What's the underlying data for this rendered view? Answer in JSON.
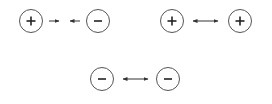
{
  "diagram": {
    "pairs": [
      {
        "left": {
          "sign": "+",
          "label": "positive-charge"
        },
        "right": {
          "sign": "−",
          "label": "negative-charge"
        },
        "relation": "attract"
      },
      {
        "left": {
          "sign": "+",
          "label": "positive-charge"
        },
        "right": {
          "sign": "+",
          "label": "positive-charge"
        },
        "relation": "repel"
      },
      {
        "left": {
          "sign": "−",
          "label": "negative-charge"
        },
        "right": {
          "sign": "−",
          "label": "negative-charge"
        },
        "relation": "repel"
      }
    ],
    "colors": {
      "stroke": "#555555",
      "background": "#ffffff"
    }
  }
}
